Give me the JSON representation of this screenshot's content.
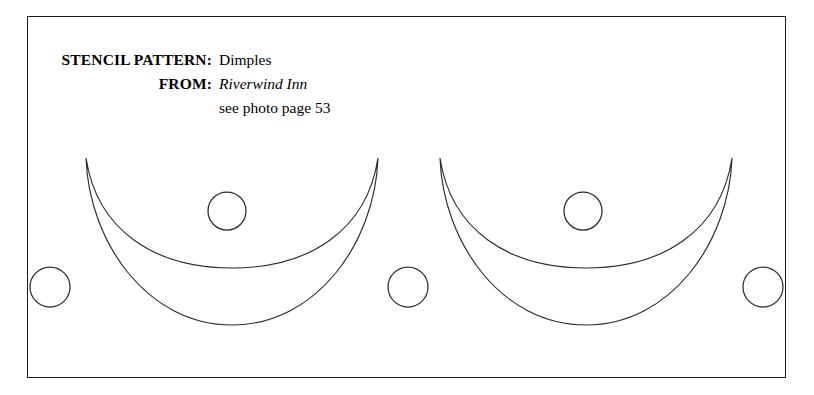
{
  "page": {
    "background_color": "#ffffff",
    "ink_color": "#2b2b2b",
    "frame_color": "#1a1a1a"
  },
  "caption": {
    "rows": [
      {
        "label": "STENCIL PATTERN:",
        "value": "Dimples",
        "style": "roman"
      },
      {
        "label": "FROM:",
        "value": "Riverwind Inn",
        "style": "italic"
      },
      {
        "label": "",
        "value": "see photo page 53",
        "style": "roman"
      }
    ]
  },
  "artwork": {
    "title": "Dimples stencil pattern",
    "crescents": [
      {
        "name": "crescent-left",
        "left_tip_x": 59,
        "right_tip_x": 351,
        "tip_y": 142,
        "outer_bottom_y": 309,
        "inner_bottom_y": 252
      },
      {
        "name": "crescent-right",
        "left_tip_x": 413,
        "right_tip_x": 705,
        "tip_y": 142,
        "outer_bottom_y": 309,
        "inner_bottom_y": 252
      }
    ],
    "dimples": [
      {
        "name": "dimple-far-left",
        "cx": 23,
        "cy": 271,
        "r": 20
      },
      {
        "name": "dimple-left-crescent",
        "cx": 200,
        "cy": 195,
        "r": 19
      },
      {
        "name": "dimple-center",
        "cx": 381,
        "cy": 271,
        "r": 20
      },
      {
        "name": "dimple-right-crescent",
        "cx": 556,
        "cy": 195,
        "r": 19
      },
      {
        "name": "dimple-far-right",
        "cx": 736,
        "cy": 271,
        "r": 20
      }
    ]
  }
}
